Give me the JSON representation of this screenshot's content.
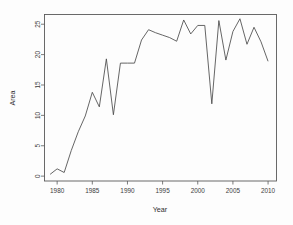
{
  "chart_data": {
    "type": "line",
    "title": "",
    "xlabel": "Year",
    "ylabel": "Area",
    "xlim": [
      1978.2,
      2011.2
    ],
    "ylim": [
      -0.8,
      26.6
    ],
    "grid": false,
    "legend": null,
    "xticks": [
      1980,
      1985,
      1990,
      1995,
      2000,
      2005,
      2010
    ],
    "xticklabels": [
      "1980",
      "1985",
      "1990",
      "1995",
      "2000",
      "2005",
      "2010"
    ],
    "yticks": [
      0,
      5,
      10,
      15,
      20,
      25
    ],
    "yticklabels": [
      "0",
      "5",
      "10",
      "15",
      "20",
      "25"
    ],
    "series": [
      {
        "name": "Area",
        "color": "#4a4a4a",
        "x": [
          1979,
          1980,
          1981,
          1982,
          1983,
          1984,
          1985,
          1986,
          1987,
          1988,
          1989,
          1990,
          1991,
          1992,
          1993,
          1994,
          1995,
          1996,
          1997,
          1998,
          1999,
          2000,
          2001,
          2002,
          2003,
          2004,
          2005,
          2006,
          2007,
          2008,
          2009,
          2010
        ],
        "values": [
          0.3,
          1.2,
          0.6,
          4.2,
          7.3,
          9.9,
          13.8,
          11.4,
          19.3,
          10.1,
          18.6,
          18.6,
          18.6,
          22.4,
          24.1,
          23.6,
          23.2,
          22.8,
          22.2,
          25.7,
          23.4,
          24.8,
          24.8,
          11.9,
          25.6,
          19.1,
          23.8,
          25.9,
          21.7,
          24.5,
          22.1,
          18.9
        ]
      }
    ]
  }
}
